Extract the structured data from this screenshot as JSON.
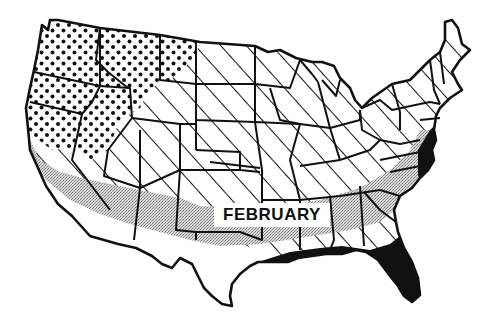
{
  "map": {
    "label": "FEBRUARY",
    "subject": "United States",
    "colors": {
      "ink": "#111111",
      "background": "#ffffff",
      "stipple": "#9a9a9a"
    },
    "zones": [
      {
        "id": "dotted",
        "pattern": "dots",
        "region": "Pacific Northwest and northern Rockies"
      },
      {
        "id": "hatched",
        "pattern": "diagonal-lines",
        "region": "Interior and northern/eastern states"
      },
      {
        "id": "stippled",
        "pattern": "gray-stipple",
        "region": "Southern band from California to the Carolinas"
      },
      {
        "id": "solid",
        "pattern": "solid-black",
        "region": "Gulf coast, Florida and Atlantic coast fringe"
      },
      {
        "id": "blank",
        "pattern": "none",
        "region": "Desert Southwest and south Texas"
      }
    ]
  }
}
